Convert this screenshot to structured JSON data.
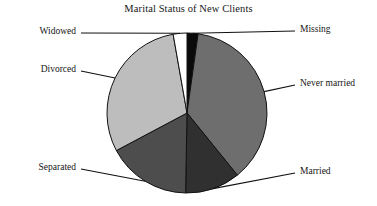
{
  "chart": {
    "title": "Marital Status of New Clients"
  },
  "chart_data": {
    "type": "pie",
    "title": "Marital Status of New Clients",
    "xlabel": "",
    "ylabel": "",
    "legend_position": "none",
    "labels_position": "callout-leader-lines",
    "grid": false,
    "categories": [
      "Missing",
      "Never married",
      "Married",
      "Separated",
      "Divorced",
      "Widowed"
    ],
    "values": [
      2,
      37,
      11,
      17,
      30,
      3
    ],
    "units": "percent",
    "start_angle_deg": 0,
    "direction": "clockwise",
    "slices": [
      {
        "label": "Missing",
        "value": 2,
        "color": "#0a0a0a",
        "start_angle_deg": 0,
        "end_angle_deg": 8,
        "label_side": "right",
        "label_x": 300,
        "label_y": 34
      },
      {
        "label": "Never married",
        "value": 37,
        "color": "#6e6e6e",
        "start_angle_deg": 8,
        "end_angle_deg": 141,
        "label_side": "right",
        "label_x": 300,
        "label_y": 88
      },
      {
        "label": "Married",
        "value": 11,
        "color": "#303030",
        "start_angle_deg": 141,
        "end_angle_deg": 181,
        "label_side": "right",
        "label_x": 300,
        "label_y": 176
      },
      {
        "label": "Separated",
        "value": 17,
        "color": "#4d4d4d",
        "start_angle_deg": 181,
        "end_angle_deg": 242,
        "label_side": "left",
        "label_x": 76,
        "label_y": 172
      },
      {
        "label": "Divorced",
        "value": 30,
        "color": "#bdbdbd",
        "start_angle_deg": 242,
        "end_angle_deg": 350,
        "label_side": "left",
        "label_x": 76,
        "label_y": 74
      },
      {
        "label": "Widowed",
        "value": 3,
        "color": "#ffffff",
        "start_angle_deg": 350,
        "end_angle_deg": 360,
        "label_side": "left",
        "label_x": 76,
        "label_y": 36
      }
    ],
    "geometry": {
      "center_x": 187,
      "center_y": 113,
      "radius": 80
    },
    "colors": {
      "missing": "#0a0a0a",
      "never_married": "#6e6e6e",
      "married": "#303030",
      "separated": "#4d4d4d",
      "divorced": "#bdbdbd",
      "widowed": "#ffffff",
      "outline": "#111111",
      "leader_line": "#111111",
      "background": "#ffffff"
    }
  }
}
